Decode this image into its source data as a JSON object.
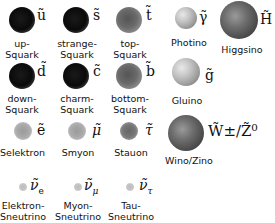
{
  "particles": {
    "up_squark": {
      "symbol": "ũ",
      "label_1": "up-",
      "label_2": "Squark"
    },
    "strange_squark": {
      "symbol": "s̃",
      "label_1": "strange-",
      "label_2": "Squark"
    },
    "top_squark": {
      "symbol": "t̃",
      "label_1": "top-",
      "label_2": "Squark"
    },
    "photino": {
      "symbol": "γ̃",
      "label_1": "Photino"
    },
    "higgsino": {
      "symbol": "H̃",
      "label_1": "Higgsino"
    },
    "down_squark": {
      "symbol": "d̃",
      "label_1": "down-",
      "label_2": "Squark"
    },
    "charm_squark": {
      "symbol": "c̃",
      "label_1": "charm-",
      "label_2": "Squark"
    },
    "bottom_squark": {
      "symbol": "b̃",
      "label_1": "bottom-",
      "label_2": "Squark"
    },
    "gluino": {
      "symbol": "g̃",
      "label_1": "Gluino"
    },
    "selektron": {
      "symbol": "ẽ",
      "label_1": "Selektron"
    },
    "smyon": {
      "symbol": "μ̃",
      "label_1": "Smyon"
    },
    "stauon": {
      "symbol": "τ̃",
      "label_1": "Stauon"
    },
    "wino_zino": {
      "symbol": "W̃±/Z̃⁰",
      "label_1": "Wino/Zino"
    },
    "elektron_sneutrino": {
      "symbol": "ν̃",
      "subscript": "e",
      "label_1": "Elektron-",
      "label_2": "Sneutrino"
    },
    "myon_sneutrino": {
      "symbol": "ν̃",
      "subscript": "μ",
      "label_1": "Myon-",
      "label_2": "Sneutrino"
    },
    "tau_sneutrino": {
      "symbol": "ν̃",
      "subscript": "τ",
      "label_1": "Tau-",
      "label_2": "Sneutrino"
    }
  }
}
